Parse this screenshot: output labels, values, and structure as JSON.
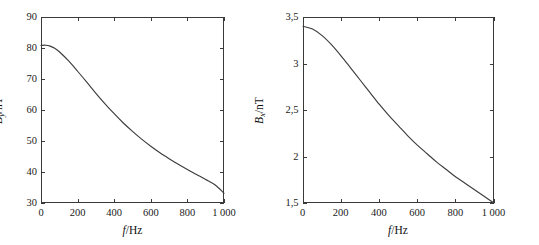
{
  "figure": {
    "background": "#ffffff",
    "axis_color": "#3a3a3a",
    "curve_color": "#3d3d3d"
  },
  "panels": [
    {
      "name": "left-panel",
      "y_axis_symbol": "B",
      "y_axis_subscript": "y",
      "y_axis_separator": "/",
      "y_axis_unit": "nT",
      "x_axis_symbol": "f",
      "x_axis_separator": "/",
      "x_axis_unit": "Hz",
      "x_ticklabels": [
        "0",
        "200",
        "400",
        "600",
        "800",
        "1 000"
      ],
      "y_ticklabels": [
        "30",
        "40",
        "50",
        "60",
        "70",
        "80",
        "90"
      ]
    },
    {
      "name": "right-panel",
      "y_axis_symbol": "B",
      "y_axis_subscript": "x",
      "y_axis_separator": "/",
      "y_axis_unit": "nT",
      "x_axis_symbol": "f",
      "x_axis_separator": "/",
      "x_axis_unit": "Hz",
      "x_ticklabels": [
        "0",
        "200",
        "400",
        "600",
        "800",
        "1 000"
      ],
      "y_ticklabels": [
        "1,5",
        "2",
        "2,5",
        "3",
        "3,5"
      ]
    }
  ],
  "chart_data": [
    {
      "type": "line",
      "title": "",
      "xlabel": "f/Hz",
      "ylabel": "B_y/nT",
      "xlim": [
        0,
        1000
      ],
      "ylim": [
        30,
        90
      ],
      "xticks": [
        0,
        200,
        400,
        600,
        800,
        1000
      ],
      "xticklabels": [
        "0",
        "200",
        "400",
        "600",
        "800",
        "1 000"
      ],
      "yticks": [
        30,
        40,
        50,
        60,
        70,
        80,
        90
      ],
      "yticklabels": [
        "30",
        "40",
        "50",
        "60",
        "70",
        "80",
        "90"
      ],
      "grid": false,
      "legend": false,
      "series": [
        {
          "name": "By",
          "x": [
            0,
            25,
            50,
            75,
            100,
            150,
            200,
            250,
            300,
            350,
            400,
            450,
            500,
            550,
            600,
            650,
            700,
            750,
            800,
            850,
            900,
            950,
            1000
          ],
          "y": [
            80.8,
            80.9,
            80.6,
            79.9,
            78.8,
            75.9,
            72.5,
            69.0,
            65.4,
            62.0,
            58.8,
            55.8,
            53.1,
            50.6,
            48.3,
            46.2,
            44.3,
            42.5,
            40.8,
            39.2,
            37.6,
            35.9,
            33.2
          ]
        }
      ]
    },
    {
      "type": "line",
      "title": "",
      "xlabel": "f/Hz",
      "ylabel": "B_x/nT",
      "xlim": [
        0,
        1000
      ],
      "ylim": [
        1.5,
        3.5
      ],
      "xticks": [
        0,
        200,
        400,
        600,
        800,
        1000
      ],
      "xticklabels": [
        "0",
        "200",
        "400",
        "600",
        "800",
        "1 000"
      ],
      "yticks": [
        1.5,
        2,
        2.5,
        3,
        3.5
      ],
      "yticklabels": [
        "1,5",
        "2",
        "2,5",
        "3",
        "3,5"
      ],
      "grid": false,
      "legend": false,
      "series": [
        {
          "name": "Bx",
          "x": [
            0,
            50,
            100,
            150,
            200,
            250,
            300,
            350,
            400,
            450,
            500,
            550,
            600,
            650,
            700,
            750,
            800,
            850,
            900,
            950,
            1000
          ],
          "y": [
            3.4,
            3.37,
            3.3,
            3.2,
            3.08,
            2.95,
            2.82,
            2.69,
            2.56,
            2.44,
            2.33,
            2.22,
            2.12,
            2.03,
            1.94,
            1.86,
            1.78,
            1.71,
            1.64,
            1.57,
            1.5
          ]
        }
      ]
    }
  ]
}
